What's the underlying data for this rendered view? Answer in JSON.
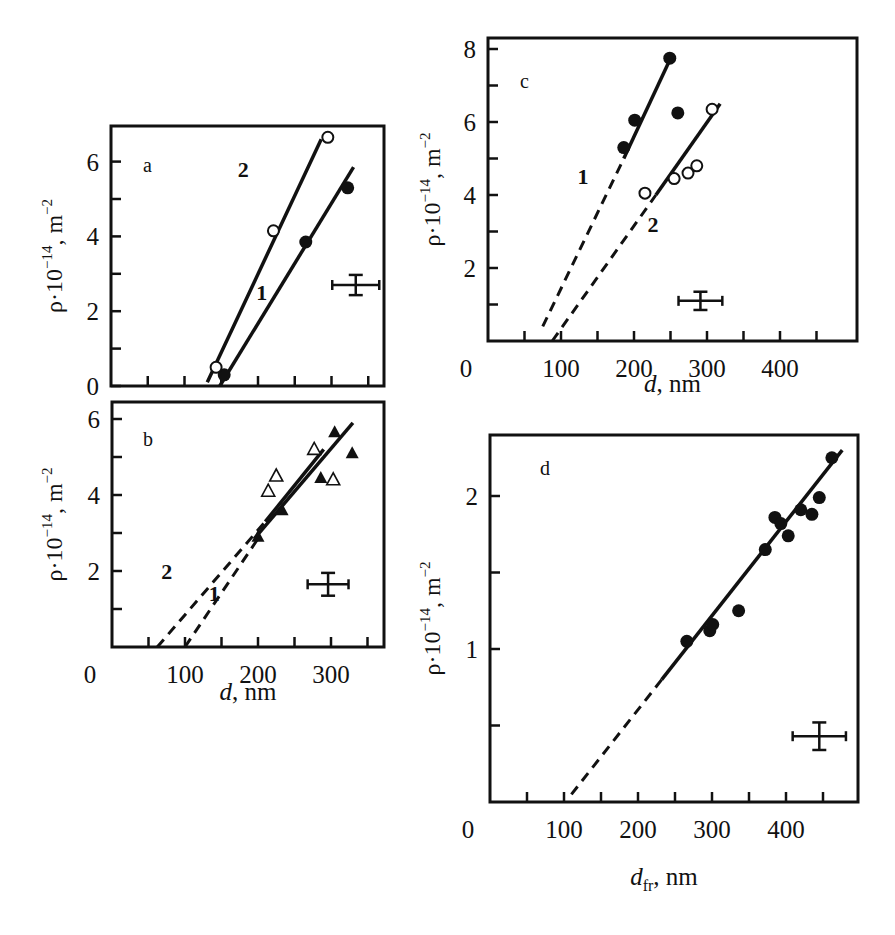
{
  "figure": {
    "panels": [
      "a",
      "b",
      "c",
      "d"
    ]
  },
  "chart_data": [
    {
      "panel": "a",
      "type": "scatter",
      "title": "a",
      "xlabel": "",
      "ylabel": "ρ·10^-14, m^-2",
      "xlim": [
        0,
        370
      ],
      "ylim": [
        0,
        6.9
      ],
      "x_ticks": [
        50,
        100,
        150,
        200,
        250,
        300,
        350
      ],
      "x_tick_labels": [],
      "y_ticks": [
        0,
        1,
        2,
        3,
        4,
        5,
        6
      ],
      "y_tick_labels": [
        "0",
        "",
        "2",
        "",
        "4",
        "",
        "6"
      ],
      "grid": false,
      "series": [
        {
          "name": "1",
          "marker": "filled-circle",
          "x": [
            154,
            265,
            322
          ],
          "y": [
            0.3,
            3.85,
            5.3
          ],
          "fit": {
            "style": "solid",
            "x": [
              148,
              330
            ],
            "y": [
              0.0,
              5.85
            ]
          },
          "label_pos": [
            205,
            2.3
          ]
        },
        {
          "name": "2",
          "marker": "open-circle",
          "x": [
            143,
            221,
            295
          ],
          "y": [
            0.5,
            4.15,
            6.65
          ],
          "fit": {
            "style": "solid",
            "x": [
              131,
              286
            ],
            "y": [
              0.1,
              6.6
            ]
          },
          "label_pos": [
            180,
            5.6
          ]
        }
      ],
      "error_bar": {
        "x": 333,
        "y": 2.7,
        "dx": 32,
        "dy": 0.27
      }
    },
    {
      "panel": "b",
      "type": "scatter",
      "title": "b",
      "xlabel": "d, nm",
      "ylabel": "ρ·10^-14, m^-2",
      "xlim": [
        0,
        370
      ],
      "ylim": [
        0,
        6.4
      ],
      "x_ticks": [
        50,
        100,
        150,
        200,
        250,
        300,
        350
      ],
      "x_tick_labels": [
        "0",
        "100",
        "200",
        "300"
      ],
      "y_ticks": [
        1,
        2,
        3,
        4,
        5,
        6
      ],
      "y_tick_labels": [
        "",
        "2",
        "",
        "4",
        "",
        "6"
      ],
      "grid": false,
      "series": [
        {
          "name": "1",
          "marker": "filled-triangle",
          "x": [
            200,
            233,
            286,
            305,
            329
          ],
          "y": [
            2.9,
            3.6,
            4.45,
            5.65,
            5.1
          ],
          "fit": {
            "style": "solid",
            "x": [
              195,
              330
            ],
            "y": [
              2.85,
              5.9
            ]
          },
          "extrapolation": {
            "style": "dashed",
            "x": [
              100,
              200
            ],
            "y": [
              0.0,
              2.85
            ]
          },
          "label_pos": [
            140,
            1.2
          ]
        },
        {
          "name": "2",
          "marker": "open-triangle",
          "x": [
            214,
            225,
            277,
            303
          ],
          "y": [
            4.1,
            4.5,
            5.2,
            4.4
          ],
          "fit": {
            "style": "solid",
            "x": [
              210,
              290
            ],
            "y": [
              3.3,
              5.2
            ]
          },
          "extrapolation": {
            "style": "dashed",
            "x": [
              62,
              210
            ],
            "y": [
              0.0,
              3.3
            ]
          },
          "label_pos": [
            75,
            1.8
          ]
        }
      ],
      "error_bar": {
        "x": 296,
        "y": 1.65,
        "dx": 28,
        "dy": 0.3
      }
    },
    {
      "panel": "c",
      "type": "scatter",
      "title": "c",
      "xlabel": "d, nm",
      "ylabel": "ρ·10^-14, m^-2",
      "xlim": [
        0,
        505
      ],
      "ylim": [
        0,
        8.3
      ],
      "x_ticks": [
        50,
        100,
        150,
        200,
        250,
        300,
        350,
        400,
        450
      ],
      "x_tick_labels": [
        "0",
        "100",
        "200",
        "300",
        "400"
      ],
      "y_ticks": [
        1,
        2,
        3,
        4,
        5,
        6,
        7,
        8
      ],
      "y_tick_labels": [
        "",
        "2",
        "",
        "4",
        "",
        "6",
        "",
        "8"
      ],
      "grid": false,
      "series": [
        {
          "name": "1",
          "marker": "filled-circle",
          "x": [
            186,
            201,
            249,
            260
          ],
          "y": [
            5.3,
            6.05,
            7.75,
            6.25
          ],
          "fit": {
            "style": "solid",
            "x": [
              186,
              249
            ],
            "y": [
              5.0,
              7.7
            ]
          },
          "extrapolation": {
            "style": "dashed",
            "x": [
              75,
              186
            ],
            "y": [
              0.4,
              5.0
            ]
          },
          "label_pos": [
            130,
            4.3
          ]
        },
        {
          "name": "2",
          "marker": "open-circle",
          "x": [
            215,
            255,
            274,
            286,
            307
          ],
          "y": [
            4.05,
            4.45,
            4.6,
            4.8,
            6.35
          ],
          "fit": {
            "style": "solid",
            "x": [
              230,
              318
            ],
            "y": [
              4.0,
              6.5
            ]
          },
          "extrapolation": {
            "style": "dashed",
            "x": [
              88,
              230
            ],
            "y": [
              0.0,
              4.0
            ]
          },
          "label_pos": [
            226,
            3.0
          ]
        }
      ],
      "error_bar": {
        "x": 291,
        "y": 1.1,
        "dx": 30,
        "dy": 0.25
      }
    },
    {
      "panel": "d",
      "type": "scatter",
      "title": "d",
      "xlabel": "d_fr, nm",
      "ylabel": "ρ·10^-14, m^-2",
      "xlim": [
        0,
        495
      ],
      "ylim": [
        0,
        2.4
      ],
      "x_ticks": [
        50,
        100,
        150,
        200,
        250,
        300,
        350,
        400,
        450
      ],
      "x_tick_labels": [
        "0",
        "100",
        "200",
        "300",
        "400"
      ],
      "y_ticks": [
        0.5,
        1,
        1.5,
        2
      ],
      "y_tick_labels": [
        "",
        "1",
        "",
        "2"
      ],
      "grid": false,
      "series": [
        {
          "name": "",
          "marker": "filled-circle",
          "x": [
            266,
            297,
            301,
            336,
            372,
            385,
            393,
            403,
            420,
            435,
            445,
            462
          ],
          "y": [
            1.05,
            1.12,
            1.16,
            1.25,
            1.65,
            1.86,
            1.82,
            1.74,
            1.91,
            1.88,
            1.99,
            2.25
          ],
          "fit": {
            "style": "solid",
            "x": [
              232,
              476
            ],
            "y": [
              0.8,
              2.3
            ]
          },
          "extrapolation": {
            "style": "dashed",
            "x": [
              110,
              232
            ],
            "y": [
              0.05,
              0.8
            ]
          },
          "label_pos": null
        }
      ],
      "error_bar": {
        "x": 445,
        "y": 0.43,
        "dx": 36,
        "dy": 0.09
      }
    }
  ]
}
